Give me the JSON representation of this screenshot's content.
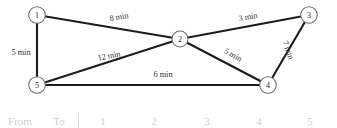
{
  "diagram": {
    "type": "undirected-weighted-graph",
    "nodes": [
      {
        "id": "1",
        "label": "1",
        "x": 37,
        "y": 15
      },
      {
        "id": "2",
        "label": "2",
        "x": 180,
        "y": 39
      },
      {
        "id": "3",
        "label": "3",
        "x": 309,
        "y": 15
      },
      {
        "id": "4",
        "label": "4",
        "x": 268,
        "y": 85
      },
      {
        "id": "5",
        "label": "5",
        "x": 37,
        "y": 85
      }
    ],
    "edges": [
      {
        "from": "1",
        "to": "2",
        "label": "8 min",
        "lx": 119,
        "ly": 17,
        "rotate": -9
      },
      {
        "from": "1",
        "to": "5",
        "label": "5 min",
        "lx": 21,
        "ly": 52,
        "rotate": 0
      },
      {
        "from": "5",
        "to": "2",
        "label": "12 min",
        "lx": 109,
        "ly": 56,
        "rotate": -12
      },
      {
        "from": "2",
        "to": "3",
        "label": "3 min",
        "lx": 248,
        "ly": 17,
        "rotate": -10
      },
      {
        "from": "2",
        "to": "4",
        "label": "5 min",
        "lx": 233,
        "ly": 55,
        "rotate": 30
      },
      {
        "from": "3",
        "to": "4",
        "label": "7 min",
        "lx": 288,
        "ly": 50,
        "rotate": 71
      },
      {
        "from": "5",
        "to": "4",
        "label": "6 min",
        "lx": 163,
        "ly": 74,
        "rotate": 0
      }
    ]
  },
  "table_strip": {
    "cells": [
      "From",
      "To",
      "1",
      "2",
      "3",
      "4",
      "5"
    ]
  }
}
